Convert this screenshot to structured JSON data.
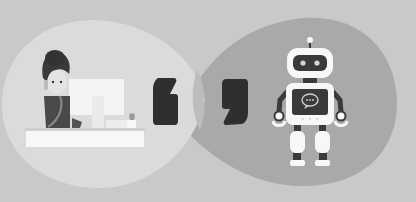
{
  "scene": {
    "description": "Illustration of a human support agent and a chatbot robot with speech bubbles and quotation marks",
    "colors": {
      "background": "#c9c9c9",
      "human_bubble": "#dcdcdc",
      "robot_bubble": "#a9a9a9",
      "quote_mark": "#2f2f2f",
      "white": "#f7f7f7",
      "dark": "#3a3a3a"
    },
    "left_quote": "opening-quote",
    "right_quote": "closing-quote",
    "robot_screen_icon": "chat-bubble-icon"
  }
}
